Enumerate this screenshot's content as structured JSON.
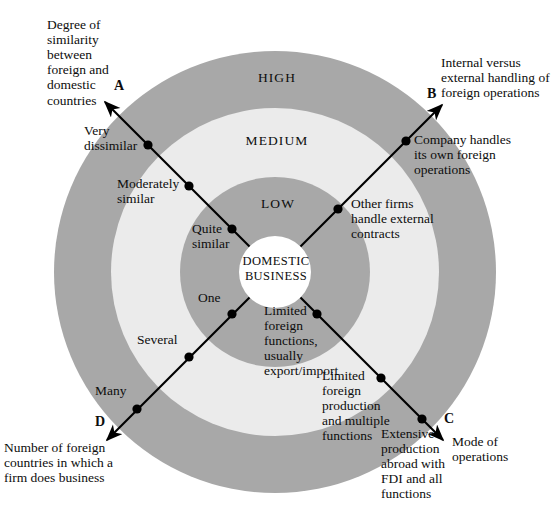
{
  "diagram": {
    "title_core": "DOMESTIC\nBUSINESS",
    "colors": {
      "ring_outer": "#a8a8a8",
      "ring_medium": "#ebebeb",
      "ring_low": "#a8a8a8",
      "core": "#ffffff",
      "axis": "#000000",
      "text": "#0d0d0d",
      "page_background": "#ffffff"
    },
    "ring_labels": [
      {
        "id": "high",
        "text": "HIGH"
      },
      {
        "id": "medium",
        "text": "MEDIUM"
      },
      {
        "id": "low",
        "text": "LOW"
      }
    ],
    "axes": [
      {
        "letter": "A",
        "caption": "Degree of\nsimilarity\nbetween\nforeign and\ndomestic\ncountries",
        "direction": "upper-left",
        "ticks": [
          {
            "label": "Very\ndissimilar",
            "ring": "high"
          },
          {
            "label": "Moderately\nsimilar",
            "ring": "medium"
          },
          {
            "label": "Quite\nsimilar",
            "ring": "low"
          }
        ]
      },
      {
        "letter": "B",
        "caption": "Internal versus\nexternal handling of\nforeign operations",
        "direction": "upper-right",
        "ticks": [
          {
            "label": "Company handles\nits own foreign\noperations",
            "ring": "high"
          },
          {
            "label": "Other firms\nhandle external\ncontracts",
            "ring": "medium"
          }
        ]
      },
      {
        "letter": "C",
        "caption": "Mode of\noperations",
        "direction": "lower-right",
        "ticks": [
          {
            "label": "Limited\nforeign\nfunctions,\nusually\nexport/import",
            "ring": "low"
          },
          {
            "label": "Limited\nforeign\nproduction\nand multiple\nfunctions",
            "ring": "medium"
          },
          {
            "label": "Extensive\nproduction\nabroad with\nFDI and all\nfunctions",
            "ring": "high"
          }
        ]
      },
      {
        "letter": "D",
        "caption": "Number of foreign\ncountries in which a\nfirm does business",
        "direction": "lower-left",
        "ticks": [
          {
            "label": "One",
            "ring": "low"
          },
          {
            "label": "Several",
            "ring": "medium"
          },
          {
            "label": "Many",
            "ring": "high"
          }
        ]
      }
    ]
  }
}
